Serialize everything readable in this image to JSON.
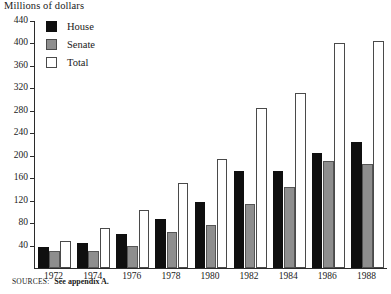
{
  "chart_data": {
    "type": "bar",
    "title": "",
    "ylabel": "Millions of dollars",
    "xlabel": "",
    "ylim": [
      0,
      440
    ],
    "ytick_step": 40,
    "yticks": [
      0,
      40,
      80,
      120,
      160,
      200,
      240,
      280,
      320,
      360,
      400,
      440
    ],
    "ytick_labels": [
      "",
      "40",
      "80",
      "120",
      "160",
      "200",
      "240",
      "280",
      "320",
      "360",
      "400",
      "440"
    ],
    "grid": false,
    "legend_position": "upper-left-inside",
    "categories": [
      "1972",
      "1974",
      "1976",
      "1978",
      "1980",
      "1982",
      "1984",
      "1986",
      "1988"
    ],
    "series": [
      {
        "name": "House",
        "color": "#0f0f0f",
        "values": [
          38,
          44,
          60,
          88,
          118,
          172,
          173,
          205,
          225
        ]
      },
      {
        "name": "Senate",
        "color": "#8e8e8e",
        "values": [
          30,
          30,
          40,
          64,
          76,
          114,
          145,
          190,
          185
        ]
      },
      {
        "name": "Total",
        "color": "#ffffff",
        "values": [
          48,
          72,
          104,
          152,
          195,
          285,
          312,
          400,
          405
        ]
      }
    ],
    "annotations": []
  },
  "legend": {
    "items": [
      {
        "label": "House",
        "swatch": "house"
      },
      {
        "label": "Senate",
        "swatch": "senate"
      },
      {
        "label": "Total",
        "swatch": "total"
      }
    ]
  },
  "source": {
    "prefix": "SOURCES:",
    "text": "See appendix A."
  }
}
